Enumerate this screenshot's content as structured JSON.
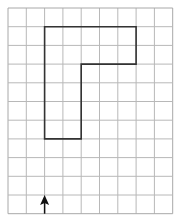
{
  "grid": {
    "columns": 9,
    "rows": 11,
    "origin_x": 8,
    "origin_y": 8,
    "cell_w": 18.3,
    "cell_h": 18.7,
    "line_color": "#b8b8b8",
    "border_color": "#a8a8a8"
  },
  "shape": {
    "type": "path-outline",
    "vertices": [
      [
        2,
        1
      ],
      [
        7,
        1
      ],
      [
        7,
        3
      ],
      [
        4,
        3
      ],
      [
        4,
        7
      ],
      [
        2,
        7
      ]
    ],
    "stroke_color": "#333333"
  },
  "arrow": {
    "direction": "up",
    "grid_x": 2,
    "from_grid_y": 11,
    "to_grid_y": 10,
    "color": "#111111"
  }
}
